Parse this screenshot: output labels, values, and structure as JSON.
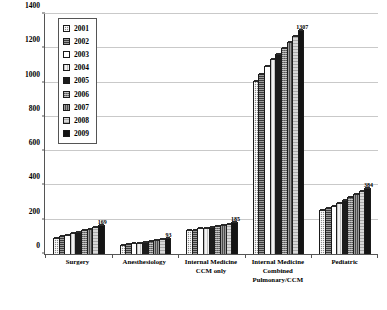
{
  "chart_data": {
    "type": "bar",
    "title": "",
    "subtitle": "",
    "xlabel": "",
    "ylabel": "",
    "ylim": [
      0,
      1400
    ],
    "ytick_step": 200,
    "yticks": [
      0,
      200,
      400,
      600,
      800,
      1000,
      1200,
      1400
    ],
    "ytick_labels": [
      "0",
      "200",
      "400",
      "600",
      "800",
      "1000",
      "1200",
      "1400"
    ],
    "grid": true,
    "grid_axis": "y",
    "legend_position": "upper-left-inside",
    "categories": [
      "Surgery",
      "Anesthesiology",
      "Internal Medicine CCM only",
      "Internal Medicine Combined Pulmonary/CCM",
      "Pediatric"
    ],
    "category_label_lines": [
      [
        "Surgery"
      ],
      [
        "Anesthesiology"
      ],
      [
        "Internal Medicine",
        "CCM only"
      ],
      [
        "Internal Medicine",
        "Combined",
        "Pulmonary/CCM"
      ],
      [
        "Pediatric"
      ]
    ],
    "series": [
      {
        "name": "2001",
        "values": [
          92,
          52,
          140,
          1012,
          258
        ]
      },
      {
        "name": "2002",
        "values": [
          105,
          57,
          143,
          1052,
          268
        ]
      },
      {
        "name": "2003",
        "values": [
          112,
          62,
          150,
          1098,
          281
        ]
      },
      {
        "name": "2004",
        "values": [
          120,
          66,
          152,
          1135,
          300
        ]
      },
      {
        "name": "2005",
        "values": [
          128,
          70,
          158,
          1168,
          318
        ]
      },
      {
        "name": "2006",
        "values": [
          138,
          75,
          162,
          1200,
          335
        ]
      },
      {
        "name": "2007",
        "values": [
          148,
          80,
          170,
          1238,
          352
        ]
      },
      {
        "name": "2008",
        "values": [
          158,
          86,
          178,
          1272,
          368
        ]
      },
      {
        "name": "2009",
        "values": [
          169,
          93,
          185,
          1307,
          384
        ]
      }
    ],
    "value_labels": [
      {
        "category": "Surgery",
        "series": "2009",
        "text": "169"
      },
      {
        "category": "Anesthesiology",
        "series": "2009",
        "text": "93"
      },
      {
        "category": "Internal Medicine CCM only",
        "series": "2009",
        "text": "185"
      },
      {
        "category": "Internal Medicine Combined Pulmonary/CCM",
        "series": "2009",
        "text": "1307"
      },
      {
        "category": "Pediatric",
        "series": "2009",
        "text": "384"
      }
    ]
  },
  "legend": {
    "items": [
      {
        "label": "2001"
      },
      {
        "label": "2002"
      },
      {
        "label": "2003"
      },
      {
        "label": "2004"
      },
      {
        "label": "2005"
      },
      {
        "label": "2006"
      },
      {
        "label": "2007"
      },
      {
        "label": "2008"
      },
      {
        "label": "2009"
      }
    ]
  },
  "colors": {
    "axis": "#555555",
    "grid": "#c9c9c9",
    "bar_outline": "#1a1a1a",
    "text": "#000000",
    "background": "#ffffff"
  }
}
